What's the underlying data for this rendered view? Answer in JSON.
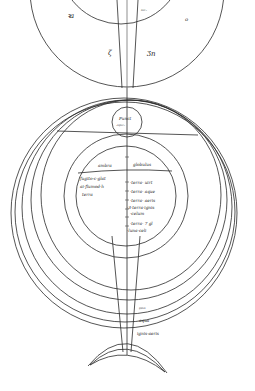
{
  "diagram": {
    "type": "manuscript-cosmological-diagram",
    "background": "#ffffff",
    "ink_color": "#2a2a2a",
    "upper_figure": {
      "labels": {
        "left": "ꝛa",
        "right": "o",
        "inner_right": "ᵃᵘᶜ·",
        "cone_left": "ζ",
        "cone_right": "Ʒn"
      }
    },
    "junction_circle": {
      "line1": "Punct",
      "line2": "·ᵃᵍᵘᵉ·"
    },
    "inner_sphere": {
      "header_left": "ambra",
      "header_right": "globulus",
      "left_text": [
        "fugito·c·glat",
        "ai·flumod·h",
        "terra"
      ],
      "right_text": [
        "·terra· uirt",
        "·terra· aque",
        "·terra· aeris",
        "·3·terra·ignis",
        "·celum",
        "·terra· 7 gl",
        "·luna·celi"
      ]
    },
    "outer_bands": {
      "labels": [
        "ᵍᵖᵘᵃ",
        "aqua",
        "ignis·aeris"
      ]
    }
  }
}
